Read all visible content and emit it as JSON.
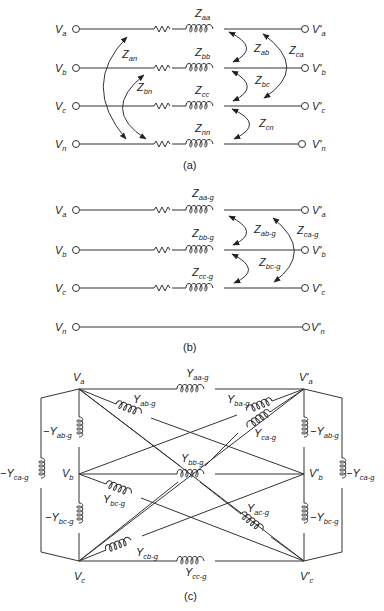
{
  "figure": {
    "parts": [
      {
        "id": "a",
        "caption": "(a)",
        "left_nodes": [
          "V_a",
          "V_b",
          "V_c",
          "V_n"
        ],
        "right_nodes": [
          "V'_a",
          "V'_b",
          "V'_c",
          "V'_n"
        ],
        "self_impedances": [
          "Z_aa",
          "Z_bb",
          "Z_cc",
          "Z_nn"
        ],
        "mutual_impedances": [
          "Z_an",
          "Z_bn",
          "Z_ab",
          "Z_bc",
          "Z_ca",
          "Z_cn"
        ]
      },
      {
        "id": "b",
        "caption": "(b)",
        "left_nodes": [
          "V_a",
          "V_b",
          "V_c",
          "V_n"
        ],
        "right_nodes": [
          "V'_a",
          "V'_b",
          "V'_c",
          "V'_n"
        ],
        "self_impedances": [
          "Z_aa-g",
          "Z_bb-g",
          "Z_cc-g"
        ],
        "mutual_impedances": [
          "Z_ab-g",
          "Z_bc-g",
          "Z_ca-g"
        ]
      },
      {
        "id": "c",
        "caption": "(c)",
        "nodes": [
          "V_a",
          "V'_a",
          "V_b",
          "V'_b",
          "V_c",
          "V'_c"
        ],
        "admittances": [
          "Y_aa-g",
          "Y_bb-g",
          "Y_cc-g",
          "Y_ab-g",
          "Y_ba-g",
          "Y_ca-g",
          "Y_bc-g",
          "Y_ac-g",
          "Y_cb-g",
          "-Y_ab-g",
          "-Y_bc-g",
          "-Y_ca-g"
        ]
      }
    ]
  },
  "labels": {
    "a": {
      "Va": {
        "m": "V",
        "s": "a"
      },
      "Vb": {
        "m": "V",
        "s": "b"
      },
      "Vc": {
        "m": "V",
        "s": "c"
      },
      "Vn": {
        "m": "V",
        "s": "n"
      },
      "Vpa": {
        "m": "V'",
        "s": "a"
      },
      "Vpb": {
        "m": "V'",
        "s": "b"
      },
      "Vpc": {
        "m": "V'",
        "s": "c"
      },
      "Vpn": {
        "m": "V'",
        "s": "n"
      },
      "Zaa": {
        "m": "Z",
        "s": "aa"
      },
      "Zbb": {
        "m": "Z",
        "s": "bb"
      },
      "Zcc": {
        "m": "Z",
        "s": "cc"
      },
      "Znn": {
        "m": "Z",
        "s": "nn"
      },
      "Zan": {
        "m": "Z",
        "s": "an"
      },
      "Zbn": {
        "m": "Z",
        "s": "bn"
      },
      "Zab": {
        "m": "Z",
        "s": "ab"
      },
      "Zbc": {
        "m": "Z",
        "s": "bc"
      },
      "Zca": {
        "m": "Z",
        "s": "ca"
      },
      "Zcn": {
        "m": "Z",
        "s": "cn"
      },
      "caption": "(a)"
    },
    "b": {
      "Va": {
        "m": "V",
        "s": "a"
      },
      "Vb": {
        "m": "V",
        "s": "b"
      },
      "Vc": {
        "m": "V",
        "s": "c"
      },
      "Vn": {
        "m": "V",
        "s": "n"
      },
      "Vpa": {
        "m": "V'",
        "s": "a"
      },
      "Vpb": {
        "m": "V'",
        "s": "b"
      },
      "Vpc": {
        "m": "V'",
        "s": "c"
      },
      "Vpn": {
        "m": "V'",
        "s": "n"
      },
      "Zaa": {
        "m": "Z",
        "s": "aa-g"
      },
      "Zbb": {
        "m": "Z",
        "s": "bb-g"
      },
      "Zcc": {
        "m": "Z",
        "s": "cc-g"
      },
      "Zab": {
        "m": "Z",
        "s": "ab-g"
      },
      "Zbc": {
        "m": "Z",
        "s": "bc-g"
      },
      "Zca": {
        "m": "Z",
        "s": "ca-g"
      },
      "caption": "(b)"
    },
    "c": {
      "Va": {
        "m": "V",
        "s": "a"
      },
      "Vpa": {
        "m": "V'",
        "s": "a"
      },
      "Vb": {
        "m": "V",
        "s": "b"
      },
      "Vpb": {
        "m": "V'",
        "s": "b"
      },
      "Vc": {
        "m": "V",
        "s": "c"
      },
      "Vpc": {
        "m": "V'",
        "s": "c"
      },
      "Yaa": {
        "m": "Y",
        "s": "aa-g"
      },
      "Ybb": {
        "m": "Y",
        "s": "bb-g"
      },
      "Ycc": {
        "m": "Y",
        "s": "cc-g"
      },
      "Yab": {
        "m": "Y",
        "s": "ab-g"
      },
      "Yba": {
        "m": "Y",
        "s": "ba-g"
      },
      "Yca": {
        "m": "Y",
        "s": "ca-g"
      },
      "Ybc": {
        "m": "Y",
        "s": "bc-g"
      },
      "Yac": {
        "m": "Y",
        "s": "ac-g"
      },
      "Ycb": {
        "m": "Y",
        "s": "cb-g"
      },
      "nYabL": {
        "m": "−Y",
        "s": "ab-g"
      },
      "nYabR": {
        "m": "−Y",
        "s": "ab-g"
      },
      "nYbcL": {
        "m": "−Y",
        "s": "bc-g"
      },
      "nYbcR": {
        "m": "−Y",
        "s": "bc-g"
      },
      "nYcaL": {
        "m": "−Y",
        "s": "ca-g"
      },
      "nYcaR": {
        "m": "−Y",
        "s": "ca-g"
      },
      "caption": "(c)"
    }
  }
}
